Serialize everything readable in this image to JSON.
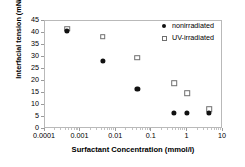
{
  "chart_data": {
    "type": "scatter",
    "title": "",
    "xlabel": "Surfactant Concentration (mmol/l)",
    "ylabel": "Interfacial tension (mN/m)",
    "xscale": "log",
    "xlim": [
      0.0001,
      10
    ],
    "ylim": [
      0,
      45
    ],
    "ytick_labels": [
      "0",
      "5",
      "10",
      "15",
      "20",
      "25",
      "30",
      "35",
      "40",
      "45"
    ],
    "ytick_values": [
      0,
      5,
      10,
      15,
      20,
      25,
      30,
      35,
      40,
      45
    ],
    "xtick_labels": [
      "0.0001",
      "0.001",
      "0.01",
      "0.1",
      "1",
      "10"
    ],
    "xtick_values": [
      0.0001,
      0.001,
      0.01,
      0.1,
      1,
      10
    ],
    "grid": false,
    "legend_position": "top-right",
    "series": [
      {
        "name": "nonirradiated",
        "marker": "filled-circle",
        "color": "#111111",
        "points": [
          {
            "x": 0.00045,
            "y": 40.6
          },
          {
            "x": 0.0045,
            "y": 27.8
          },
          {
            "x": 0.042,
            "y": 16.2
          },
          {
            "x": 0.45,
            "y": 6.2
          },
          {
            "x": 1.05,
            "y": 6.2
          },
          {
            "x": 4.3,
            "y": 6.3
          }
        ]
      },
      {
        "name": "UV-irradiated",
        "marker": "open-square",
        "color": "#6f6f6f",
        "points": [
          {
            "x": 0.00045,
            "y": 41.3
          },
          {
            "x": 0.0045,
            "y": 38.0
          },
          {
            "x": 0.042,
            "y": 29.3
          },
          {
            "x": 0.45,
            "y": 18.7
          },
          {
            "x": 1.05,
            "y": 14.6
          },
          {
            "x": 4.3,
            "y": 7.8
          }
        ]
      }
    ]
  },
  "legend": {
    "entries": [
      {
        "label": "nonirradiated"
      },
      {
        "label": "UV-irradiated"
      }
    ]
  }
}
